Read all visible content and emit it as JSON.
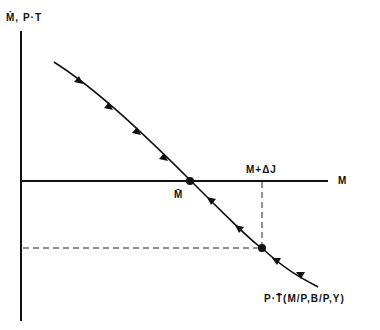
{
  "diagram": {
    "y_axis_label": "Ṁ, P·T",
    "x_axis_label": "M",
    "equilibrium_label": "M̄",
    "shock_label": "M+ΔJ",
    "curve_label": "P·T̄(M/P,B/P,Y)",
    "colors": {
      "line": "#111111",
      "background": "#ffffff"
    }
  }
}
